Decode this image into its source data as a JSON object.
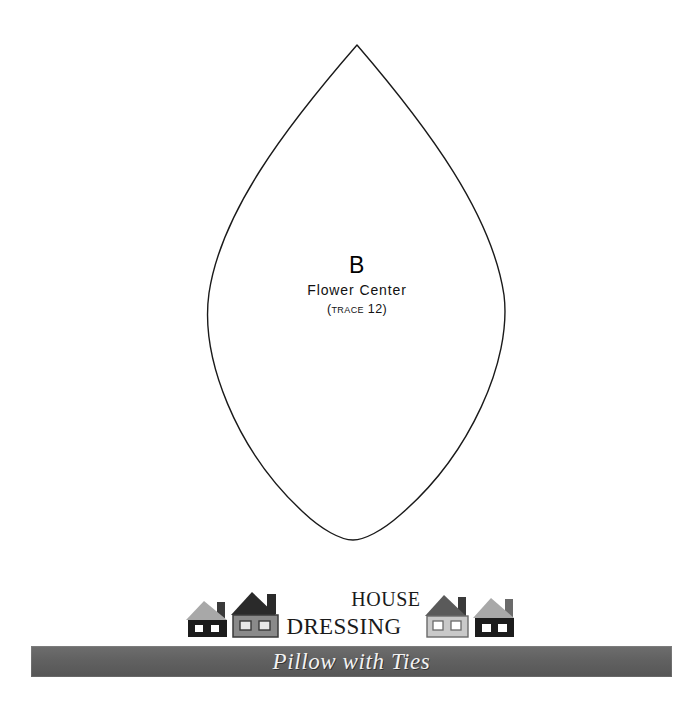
{
  "page": {
    "background_color": "#ffffff",
    "type": "sewing-pattern-template-sheet"
  },
  "pattern_piece": {
    "shape": "lens-leaf-outline",
    "outline_color": "#1a1a1a",
    "fill_color": "#ffffff",
    "letter": "B",
    "name": "Flower Center",
    "note": "(Trace 12)",
    "note_prefix": "(",
    "note_word": "Trace",
    "note_count": "12",
    "note_suffix": ")"
  },
  "brand": {
    "word_top": "House",
    "word_bottom": "Dressing",
    "icon_name": "house-icon",
    "houses": [
      {
        "id": "house-1",
        "roof_color": "#a8a8a8",
        "body_color": "#1c1c1c",
        "chimney_color": "#3a3a3a",
        "window_color": "#ffffff"
      },
      {
        "id": "house-2",
        "roof_color": "#2a2a2a",
        "body_color": "#8a8a8a",
        "chimney_color": "#2a2a2a",
        "window_color": "#e8e8e8"
      },
      {
        "id": "house-3",
        "roof_color": "#5a5a5a",
        "body_color": "#c9c9c9",
        "chimney_color": "#3a3a3a",
        "window_color": "#ffffff"
      },
      {
        "id": "house-4",
        "roof_color": "#a8a8a8",
        "body_color": "#1c1c1c",
        "chimney_color": "#6a6a6a",
        "window_color": "#ffffff"
      }
    ]
  },
  "banner": {
    "title": "Pillow with Ties",
    "background_color": "#616161",
    "text_color": "#f2f2f2"
  }
}
